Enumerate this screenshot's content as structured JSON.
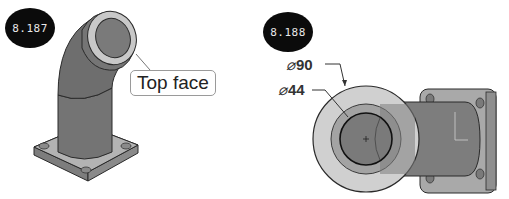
{
  "figures": [
    {
      "id": "8.187",
      "badge_label": "8.187",
      "callout_label": "Top face",
      "description": "Isometric view of elbow pipe fitting with square flange base"
    },
    {
      "id": "8.188",
      "badge_label": "8.188",
      "dimensions": [
        {
          "symbol": "⌀",
          "value": "90"
        },
        {
          "symbol": "⌀",
          "value": "44"
        }
      ],
      "description": "Top view of elbow fitting showing outer and inner diameters"
    }
  ],
  "colors": {
    "badge_bg": "#0b0b0b",
    "part_dark": "#6f6f6f",
    "part_mid": "#8c8c8c",
    "part_light": "#c9c9c9",
    "outline": "#2a2a2a"
  }
}
